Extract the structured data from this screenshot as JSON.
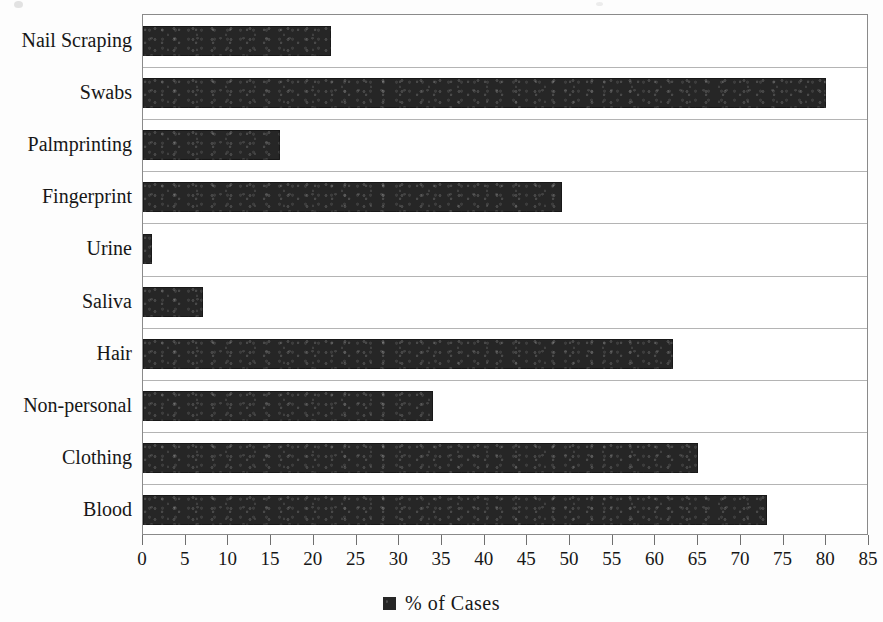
{
  "chart_data": {
    "type": "bar",
    "orientation": "horizontal",
    "title": "",
    "xlabel": "",
    "ylabel": "",
    "xlim": [
      0,
      85
    ],
    "xtick_step": 5,
    "grid": true,
    "legend_position": "bottom",
    "categories": [
      "Nail Scraping",
      "Swabs",
      "Palmprinting",
      "Fingerprint",
      "Urine",
      "Saliva",
      "Hair",
      "Non-personal",
      "Clothing",
      "Blood"
    ],
    "values": [
      22,
      80,
      16,
      49,
      1,
      7,
      62,
      34,
      65,
      73
    ],
    "xticks": [
      0,
      5,
      10,
      15,
      20,
      25,
      30,
      35,
      40,
      45,
      50,
      55,
      60,
      65,
      70,
      75,
      80,
      85
    ],
    "series": [
      {
        "name": "% of Cases",
        "color": "#262626",
        "values": [
          22,
          80,
          16,
          49,
          1,
          7,
          62,
          34,
          65,
          73
        ]
      }
    ],
    "legend": [
      "% of Cases"
    ]
  },
  "legend": {
    "label": "% of Cases",
    "swatch_color": "#262626"
  },
  "style": {
    "bar_color": "#262626",
    "grid_color": "#b4b4b4",
    "frame_color": "#8a8a8a",
    "text_color": "#171717",
    "background": "#fdfdfd"
  }
}
